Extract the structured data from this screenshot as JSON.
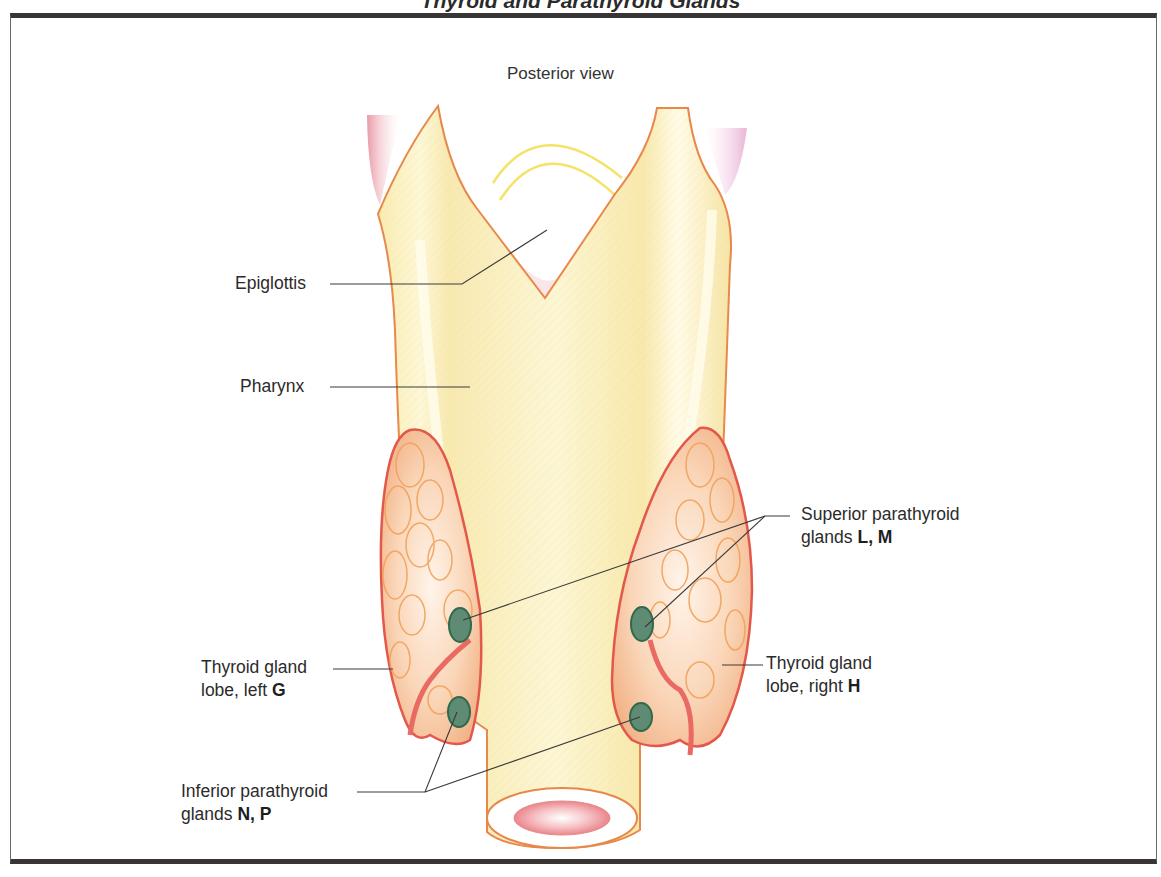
{
  "title": "Thyroid and Parathyroid Glands",
  "view": "Posterior view",
  "labels": {
    "epiglottis": "Epiglottis",
    "pharynx": "Pharynx",
    "superior": {
      "line1": "Superior parathyroid",
      "line2_text": "glands ",
      "line2_bold": "L, M"
    },
    "thyroid_left": {
      "line1": "Thyroid gland",
      "line2_text": "lobe, left ",
      "line2_bold": "G"
    },
    "thyroid_right": {
      "line1": "Thyroid gland",
      "line2_text": "lobe, right ",
      "line2_bold": "H"
    },
    "inferior": {
      "line1": "Inferior parathyroid",
      "line2_text": "glands ",
      "line2_bold": "N, P"
    }
  },
  "colors": {
    "pharynx_fill": "#fbf2bf",
    "pharynx_outline": "#e8874a",
    "thyroid_fill": "#f6c9a6",
    "thyroid_outline": "#e2584a",
    "parathyroid_fill": "#5f8a74",
    "parathyroid_outline": "#2f6a4c",
    "leader_line": "#3a3a3a",
    "frame": "#3a3535"
  }
}
